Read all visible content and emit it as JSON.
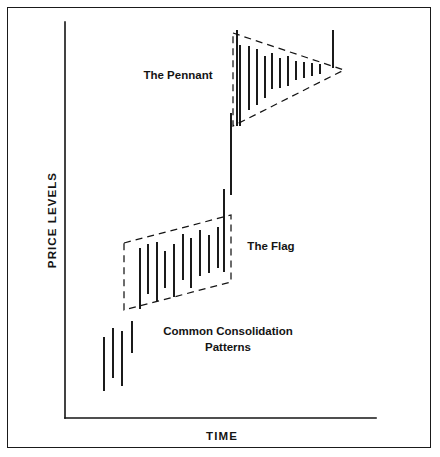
{
  "figure": {
    "title_caption": "Common Consolidation Patterns",
    "axes": {
      "y_label": "PRICE LEVELS",
      "x_label": "TIME",
      "y_axis": {
        "x": 65,
        "y_top": 22,
        "y_bottom": 418
      },
      "x_axis": {
        "y": 418,
        "x_left": 65,
        "x_right": 376
      }
    },
    "annotations": [
      {
        "name": "pennant-label",
        "text": "The Pennant",
        "x": 178,
        "y": 79
      },
      {
        "name": "flag-label",
        "text": "The Flag",
        "x": 271,
        "y": 250
      },
      {
        "name": "caption-line-1",
        "text": "Common Consolidation",
        "x": 228,
        "y": 335
      },
      {
        "name": "caption-line-2",
        "text": "Patterns",
        "x": 228,
        "y": 351
      }
    ]
  },
  "chart_data": {
    "type": "bar",
    "subtype": "price-range-bars",
    "xlabel": "TIME",
    "ylabel": "PRICE LEVELS",
    "grid": false,
    "legend": false,
    "axis_note": "Unlabeled schematic axes; values are pixel-space high/low price range bars",
    "xlim": [
      65,
      376
    ],
    "ylim_pixels": [
      22,
      418
    ],
    "series": [
      {
        "name": "uptrend-leading-bars",
        "bars": [
          {
            "x": 104,
            "top": 337,
            "bottom": 391
          },
          {
            "x": 113,
            "top": 328,
            "bottom": 378
          },
          {
            "x": 122,
            "top": 331,
            "bottom": 386
          },
          {
            "x": 132,
            "top": 321,
            "bottom": 353
          }
        ]
      },
      {
        "name": "flag-consolidation-bars",
        "bars": [
          {
            "x": 140,
            "top": 248,
            "bottom": 309
          },
          {
            "x": 148,
            "top": 244,
            "bottom": 294
          },
          {
            "x": 157,
            "top": 242,
            "bottom": 301
          },
          {
            "x": 165,
            "top": 251,
            "bottom": 288
          },
          {
            "x": 174,
            "top": 244,
            "bottom": 297
          },
          {
            "x": 183,
            "top": 234,
            "bottom": 280
          },
          {
            "x": 191,
            "top": 238,
            "bottom": 288
          },
          {
            "x": 200,
            "top": 230,
            "bottom": 276
          },
          {
            "x": 209,
            "top": 235,
            "bottom": 273
          },
          {
            "x": 218,
            "top": 227,
            "bottom": 268
          }
        ]
      },
      {
        "name": "flag-breakout-bars",
        "bars": [
          {
            "x": 224,
            "top": 189,
            "bottom": 272
          },
          {
            "x": 231,
            "top": 113,
            "bottom": 195
          },
          {
            "x": 237,
            "top": 30,
            "bottom": 126
          }
        ]
      },
      {
        "name": "pennant-consolidation-bars",
        "bars": [
          {
            "x": 240,
            "top": 45,
            "bottom": 126
          },
          {
            "x": 249,
            "top": 46,
            "bottom": 110
          },
          {
            "x": 257,
            "top": 49,
            "bottom": 105
          },
          {
            "x": 265,
            "top": 56,
            "bottom": 98
          },
          {
            "x": 272,
            "top": 53,
            "bottom": 89
          },
          {
            "x": 280,
            "top": 58,
            "bottom": 88
          },
          {
            "x": 288,
            "top": 56,
            "bottom": 86
          },
          {
            "x": 296,
            "top": 61,
            "bottom": 80
          },
          {
            "x": 304,
            "top": 62,
            "bottom": 78
          },
          {
            "x": 312,
            "top": 63,
            "bottom": 76
          },
          {
            "x": 320,
            "top": 64,
            "bottom": 74
          }
        ]
      },
      {
        "name": "pennant-breakout-bar",
        "bars": [
          {
            "x": 333,
            "top": 30,
            "bottom": 68
          }
        ]
      }
    ],
    "shapes": [
      {
        "name": "flag-parallelogram",
        "kind": "parallelogram",
        "style": "dashed",
        "points": [
          [
            124,
            243
          ],
          [
            231,
            215
          ],
          [
            231,
            282
          ],
          [
            124,
            310
          ]
        ]
      },
      {
        "name": "pennant-triangle",
        "kind": "triangle",
        "style": "dashed",
        "points": [
          [
            233,
            33
          ],
          [
            344,
            70
          ],
          [
            233,
            126
          ]
        ]
      }
    ]
  }
}
